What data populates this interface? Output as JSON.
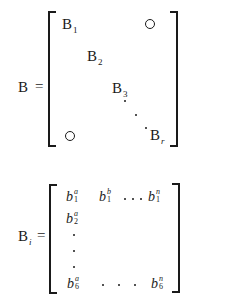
{
  "figure": {
    "matrix_b": {
      "lhs_symbol": "B",
      "equals": "=",
      "diagonal_blocks": [
        {
          "base": "B",
          "sub": "1"
        },
        {
          "base": "B",
          "sub": "2"
        },
        {
          "base": "B",
          "sub": "3"
        },
        {
          "base": "B",
          "sub": "r"
        }
      ],
      "off_diagonal_symbol": "○",
      "ellipsis": "diagonal dots"
    },
    "matrix_bi": {
      "lhs_symbol": "B",
      "lhs_sub": "i",
      "equals": "=",
      "row1": [
        {
          "base": "b",
          "sup": "a",
          "sub": "1"
        },
        {
          "base": "b",
          "sup": "b",
          "sub": "1"
        },
        {
          "base": "b",
          "sup": "n",
          "sub": "1"
        }
      ],
      "row2": [
        {
          "base": "b",
          "sup": "a",
          "sub": "2"
        }
      ],
      "last_row": [
        {
          "base": "b",
          "sup": "a",
          "sub": "6"
        },
        {
          "base": "b",
          "sup": "n",
          "sub": "6"
        }
      ]
    }
  }
}
